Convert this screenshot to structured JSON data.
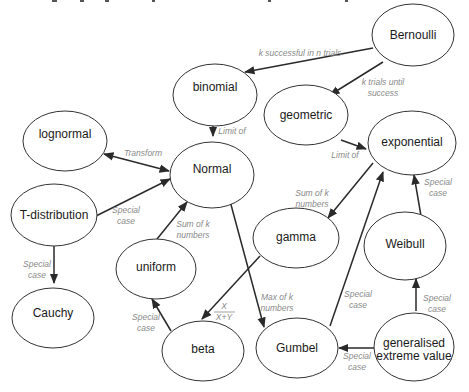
{
  "diagram": {
    "type": "directed-graph",
    "title_fragment_cropped": true,
    "nodes": {
      "bernoulli": {
        "label": "Bernoulli",
        "cx": 413,
        "cy": 35,
        "rx": 41,
        "ry": 31
      },
      "binomial": {
        "label": "binomial",
        "cx": 215,
        "cy": 95,
        "rx": 42,
        "ry": 31
      },
      "geometric": {
        "label": "geometric",
        "cx": 306,
        "cy": 115,
        "rx": 42,
        "ry": 30
      },
      "lognormal": {
        "label": "lognormal",
        "cx": 65,
        "cy": 135,
        "rx": 42,
        "ry": 30
      },
      "normal": {
        "label": "Normal",
        "cx": 212,
        "cy": 170,
        "rx": 42,
        "ry": 33
      },
      "exponential": {
        "label": "exponential",
        "cx": 412,
        "cy": 143,
        "rx": 44,
        "ry": 32
      },
      "tdist": {
        "label": "T-distribution",
        "cx": 54,
        "cy": 215,
        "rx": 43,
        "ry": 31
      },
      "gamma": {
        "label": "gamma",
        "cx": 296,
        "cy": 238,
        "rx": 43,
        "ry": 30
      },
      "weibull": {
        "label": "Weibull",
        "cx": 405,
        "cy": 244,
        "rx": 41,
        "ry": 34
      },
      "cauchy": {
        "label": "Cauchy",
        "cx": 53,
        "cy": 314,
        "rx": 41,
        "ry": 30
      },
      "uniform": {
        "label": "uniform",
        "cx": 156,
        "cy": 268,
        "rx": 40,
        "ry": 30
      },
      "beta": {
        "label": "beta",
        "cx": 203,
        "cy": 350,
        "rx": 41,
        "ry": 30
      },
      "gumbel": {
        "label": "Gumbel",
        "cx": 297,
        "cy": 348,
        "rx": 41,
        "ry": 30
      },
      "gev": {
        "label_line1": "generalised",
        "label_line2": "extreme value",
        "cx": 414,
        "cy": 345,
        "rx": 40,
        "ry": 34
      }
    },
    "edges": [
      {
        "from": "Bernoulli",
        "to": "binomial",
        "label": "k successful in n trials"
      },
      {
        "from": "Bernoulli",
        "to": "geometric",
        "label_line1": "k trials until",
        "label_line2": "success"
      },
      {
        "from": "binomial",
        "to": "Normal",
        "label": "Limit of"
      },
      {
        "from": "geometric",
        "to": "exponential",
        "label": "Limit of"
      },
      {
        "from": "lognormal",
        "to": "Normal",
        "label": "Transform",
        "bidirectional": true
      },
      {
        "from": "T-distribution",
        "to": "Normal",
        "label_line1": "Special",
        "label_line2": "case"
      },
      {
        "from": "T-distribution",
        "to": "Cauchy",
        "label_line1": "Special",
        "label_line2": "case"
      },
      {
        "from": "uniform",
        "to": "Normal",
        "label_line1": "Sum of k",
        "label_line2": "numbers"
      },
      {
        "from": "exponential",
        "to": "gamma",
        "label_line1": "Sum of k",
        "label_line2": "numbers"
      },
      {
        "from": "gamma",
        "to": "beta",
        "label_numerator": "X",
        "label_denominator": "X+Y"
      },
      {
        "from": "beta",
        "to": "uniform",
        "label_line1": "Special",
        "label_line2": "case"
      },
      {
        "from": "Normal",
        "to": "Gumbel",
        "label_line1": "Max of k",
        "label_line2": "numbers"
      },
      {
        "from": "Gumbel",
        "to": "exponential",
        "label_line1": "Special",
        "label_line2": "case"
      },
      {
        "from": "Weibull",
        "to": "exponential",
        "label_line1": "Special",
        "label_line2": "case"
      },
      {
        "from": "generalised extreme value",
        "to": "Weibull",
        "label_line1": "Special",
        "label_line2": "case"
      },
      {
        "from": "generalised extreme value",
        "to": "Gumbel",
        "label_line1": "Special",
        "label_line2": "case"
      }
    ]
  },
  "colors": {
    "node_stroke": "#333333",
    "edge": "#2a2a2a",
    "edge_label": "#8a8a8a",
    "text": "#1a1a1a"
  }
}
